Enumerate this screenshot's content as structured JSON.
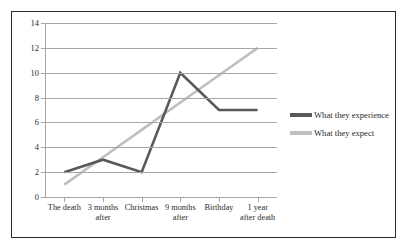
{
  "chart_data": {
    "type": "line",
    "title": "",
    "xlabel": "",
    "ylabel": "",
    "categories": [
      "The death",
      "3 months\nafter",
      "Christmas",
      "9 months\nafter",
      "Birthday",
      "1 year\nafter death"
    ],
    "series": [
      {
        "name": "What they experience",
        "color": "#595959",
        "values": [
          2,
          3,
          2,
          10,
          7,
          7
        ]
      },
      {
        "name": "What they expect",
        "color": "#bfbfbf",
        "values": [
          1,
          3.2,
          5.4,
          7.6,
          9.8,
          12
        ]
      }
    ],
    "ylim": [
      0,
      14
    ],
    "y_ticks": [
      0,
      2,
      4,
      6,
      8,
      10,
      12,
      14
    ],
    "y_tick_labels": [
      "0",
      "2",
      "4",
      "6",
      "8",
      "10",
      "12",
      "14"
    ],
    "grid": true,
    "grid_color": "#a6a6a6",
    "legend_position": "right",
    "plot_background": "#ffffff",
    "frame_color": "#2b2b2b"
  },
  "legend": {
    "entries": [
      {
        "label": "What they experience"
      },
      {
        "label": "What they expect"
      }
    ]
  }
}
